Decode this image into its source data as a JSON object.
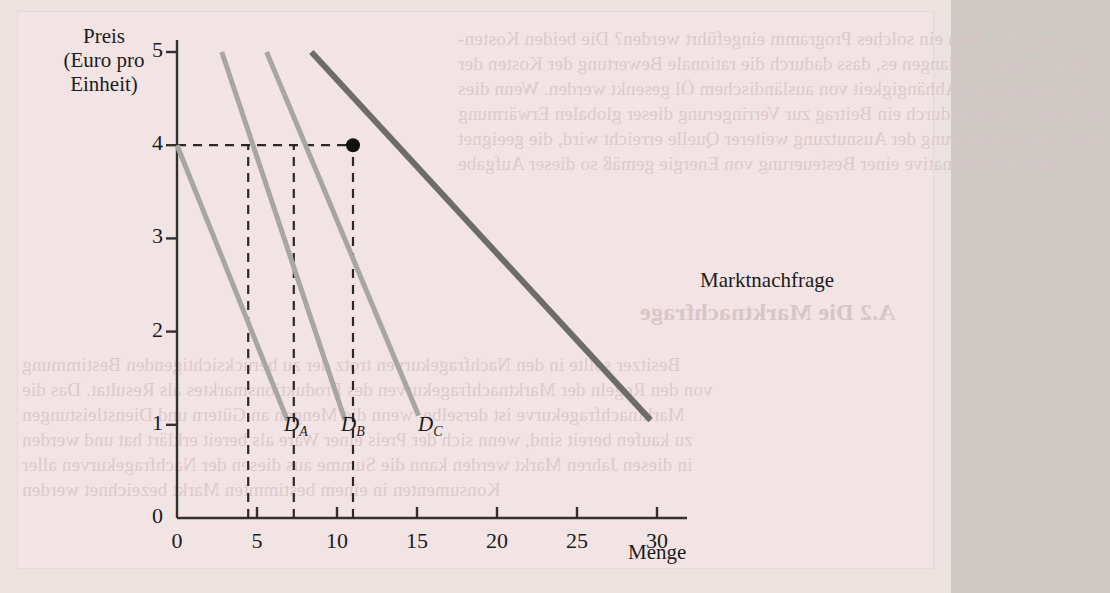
{
  "figure": {
    "background_color": "#f2e4e4",
    "page_color": "#ece3e1"
  },
  "axes": {
    "y_title_line1": "Preis",
    "y_title_line2": "(Euro pro",
    "y_title_line3": "Einheit)",
    "x_title": "Menge",
    "y_ticks": [
      "0",
      "1",
      "2",
      "3",
      "4",
      "5"
    ],
    "x_ticks": [
      "0",
      "5",
      "10",
      "15",
      "20",
      "25",
      "30"
    ]
  },
  "labels": {
    "curve_a": "D",
    "curve_a_sub": "A",
    "curve_b": "D",
    "curve_b_sub": "B",
    "curve_c": "D",
    "curve_c_sub": "C",
    "market": "Marktnachfrage"
  },
  "bleed_text": {
    "top": [
      "Wenn sollte dann ein solches Programm eingeführt werden? Die beiden Kosten-",
      "Bewertungen verlangen es, dass dadurch die rationale Bewertung der Kosten der",
      "Verringerung der Abhängigkeit von ausländischem Öl gesenkt werden. Wenn dies",
      "der wird, so dass dadurch ein Beitrag zur Verringerung dieser globalen Erwärmung",
      "durch eine Verringerung der Ausnutzung weiterer Quelle erreicht wird, die geeignet",
      "ist, und Die Alternative einer Besteuerung von Energie gemäß so dieser Aufgabe"
    ],
    "mid": [
      "Besitzer sollte in den Nachfragekurven trotz der zu berücksichtigenden Bestimmung",
      "von den Regeln der Marktnachfragekurven des Produktionsmarktes als Resultat. Das die",
      "Marktnachfragekurve ist derselbe, wenn die Mengen an Gütern und Dienstleistungen",
      "zu kaufen bereit sind, wenn sich der Preis einer Ware als bereit erklärt hat und werden",
      "in diesen Jahren Markt werden kann die Summe aus diesen der Nachfragekurven aller",
      "Konsumenten in einem bestimmten Markt bezeichnet werden"
    ],
    "right": [
      "A.2  Die Marktnachfrage"
    ]
  },
  "chart_data": {
    "type": "line",
    "title": "",
    "xlabel": "Menge",
    "ylabel": "Preis (Euro pro Einheit)",
    "xlim": [
      0,
      30
    ],
    "ylim": [
      0,
      5
    ],
    "grid": false,
    "legend": "inline-labels",
    "series": [
      {
        "name": "D_A",
        "label": "DA",
        "color": "#a8a6a5",
        "width": 5,
        "points": [
          [
            0.0,
            4.0
          ],
          [
            6.9,
            1.05
          ]
        ],
        "annotation": "Individuelle Nachfrage A"
      },
      {
        "name": "D_B",
        "label": "DB",
        "color": "#a8a6a5",
        "width": 5,
        "points": [
          [
            2.8,
            5.0
          ],
          [
            10.5,
            1.05
          ]
        ],
        "annotation": "Individuelle Nachfrage B"
      },
      {
        "name": "D_C",
        "label": "DC",
        "color": "#a8a6a5",
        "width": 5,
        "points": [
          [
            5.6,
            5.0
          ],
          [
            15.1,
            1.1
          ]
        ],
        "annotation": "Individuelle Nachfrage C"
      },
      {
        "name": "Marktnachfrage",
        "label": "Marktnachfrage",
        "color": "#6e6c6b",
        "width": 6,
        "points": [
          [
            8.4,
            5.0
          ],
          [
            29.6,
            1.05
          ]
        ],
        "annotation": "Summe der individuellen Nachfragen"
      }
    ],
    "marked_point": {
      "x": 11.0,
      "y": 4.0,
      "color": "#111111",
      "radius": 7
    },
    "dashed_guides": {
      "horizontal": [
        {
          "y": 4.0,
          "from_x": 0,
          "to_x": 11.0
        }
      ],
      "vertical": [
        {
          "x": 4.45,
          "from_y": 0,
          "to_y": 4.0
        },
        {
          "x": 7.3,
          "from_y": 0,
          "to_y": 4.0
        },
        {
          "x": 11.0,
          "from_y": 0,
          "to_y": 4.0
        }
      ]
    }
  }
}
